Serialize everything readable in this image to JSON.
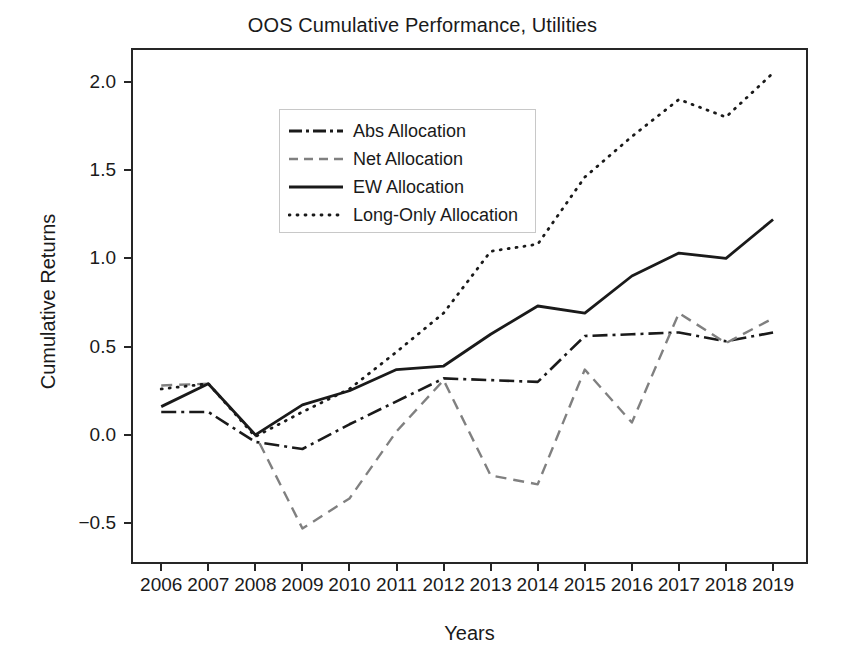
{
  "chart_data": {
    "type": "line",
    "title": "OOS Cumulative Performance, Utilities",
    "xlabel": "Years",
    "ylabel": "Cumulative Returns",
    "x": [
      2006,
      2007,
      2008,
      2009,
      2010,
      2011,
      2012,
      2013,
      2014,
      2015,
      2016,
      2017,
      2018,
      2019
    ],
    "categories": [
      "2006",
      "2007",
      "2008",
      "2009",
      "2010",
      "2011",
      "2012",
      "2013",
      "2014",
      "2015",
      "2016",
      "2017",
      "2018",
      "2019"
    ],
    "xlim": [
      2005.4,
      2019.7
    ],
    "ylim": [
      -0.72,
      2.18
    ],
    "yticks": [
      -0.5,
      0.0,
      0.5,
      1.0,
      1.5,
      2.0
    ],
    "ytick_labels": [
      "−0.5",
      "0.0",
      "0.5",
      "1.0",
      "1.5",
      "2.0"
    ],
    "grid": false,
    "legend_position": "upper left",
    "series": [
      {
        "name": "Abs Allocation",
        "style": "dashdot",
        "color": "#1a1a1a",
        "width": 2.6,
        "values": [
          0.13,
          0.13,
          -0.04,
          -0.08,
          0.06,
          0.19,
          0.32,
          0.31,
          0.3,
          0.56,
          0.57,
          0.58,
          0.53,
          0.58
        ]
      },
      {
        "name": "Net Allocation",
        "style": "dashed",
        "color": "#808080",
        "width": 2.4,
        "values": [
          0.28,
          0.29,
          0.0,
          -0.53,
          -0.36,
          0.02,
          0.31,
          -0.23,
          -0.28,
          0.37,
          0.07,
          0.69,
          0.52,
          0.66
        ]
      },
      {
        "name": "EW Allocation",
        "style": "solid",
        "color": "#1a1a1a",
        "width": 2.8,
        "values": [
          0.16,
          0.29,
          0.0,
          0.17,
          0.25,
          0.37,
          0.39,
          0.57,
          0.73,
          0.69,
          0.9,
          1.03,
          1.0,
          1.22
        ]
      },
      {
        "name": "Long-Only Allocation",
        "style": "dotted",
        "color": "#1a1a1a",
        "width": 2.8,
        "values": [
          0.26,
          0.29,
          -0.01,
          0.13,
          0.26,
          0.47,
          0.69,
          1.04,
          1.08,
          1.46,
          1.69,
          1.9,
          1.8,
          2.05
        ]
      }
    ]
  }
}
